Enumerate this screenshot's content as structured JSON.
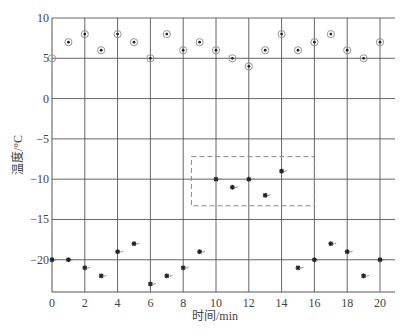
{
  "chart_data": {
    "type": "scatter",
    "title": "",
    "xlabel": "时间/min",
    "ylabel": "温度/°C",
    "xlim": [
      0,
      20.9
    ],
    "ylim": [
      -24,
      10
    ],
    "x_ticks": [
      0,
      2,
      4,
      6,
      8,
      10,
      12,
      14,
      16,
      18,
      20
    ],
    "y_ticks": [
      10,
      5,
      0,
      -5,
      -10,
      -15,
      -20
    ],
    "y_tick_labels": [
      "10",
      "5",
      "0",
      "−5",
      "−10",
      "−15",
      "−20"
    ],
    "grid": true,
    "legend": null,
    "series": [
      {
        "name": "upper",
        "marker": "circle-dot",
        "x": [
          0,
          1,
          2,
          3,
          4,
          5,
          6,
          7,
          8,
          9,
          10,
          11,
          12,
          13,
          14,
          15,
          16,
          17,
          18,
          19,
          20
        ],
        "y": [
          5,
          7,
          8,
          6,
          8,
          7,
          5,
          8,
          6,
          7,
          6,
          5,
          4,
          6,
          8,
          6,
          7,
          8,
          6,
          5,
          7
        ],
        "first_point_open": true
      },
      {
        "name": "lower",
        "marker": "asterisk",
        "x": [
          0,
          1,
          2,
          3,
          4,
          5,
          6,
          7,
          8,
          9,
          10,
          11,
          12,
          13,
          14,
          15,
          16,
          17,
          18,
          19,
          20
        ],
        "y": [
          -20,
          -20,
          -21,
          -22,
          -19,
          -18,
          -23,
          -22,
          -21,
          -19,
          -10,
          -11,
          -10,
          -12,
          -9,
          -21,
          -20,
          -18,
          -19,
          -22,
          -20
        ]
      }
    ],
    "annotations": [
      {
        "type": "dashed-rectangle",
        "x0": 8.5,
        "x1": 16,
        "y0": -13.3,
        "y1": -7.2,
        "note": "highlights points at x=10..14"
      }
    ]
  }
}
